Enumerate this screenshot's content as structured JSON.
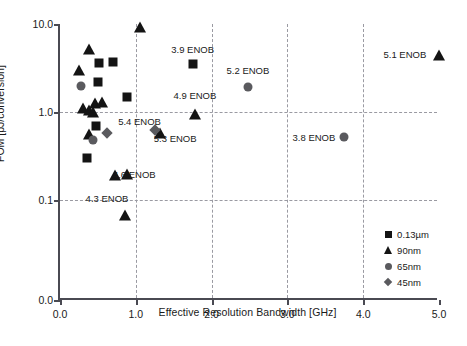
{
  "chart_data": {
    "type": "scatter",
    "title": "",
    "xlabel": "Effective Resolution Bandwidth [GHz]",
    "ylabel": "FOM [pJ/conversion]",
    "xlim": [
      0.0,
      5.0
    ],
    "ylim": [
      0.1,
      10.0
    ],
    "yscale": "log",
    "xscale": "linear",
    "grid": true,
    "legend_position": "bottom-right",
    "xticks": [
      "0.0",
      "1.0",
      "2.0",
      "3.0",
      "4.0",
      "5.0"
    ],
    "xtick_values": [
      0.0,
      1.0,
      2.0,
      3.0,
      4.0,
      5.0
    ],
    "yticks": [
      "0.0",
      "0.1",
      "1.0",
      "10.0"
    ],
    "ytick_values": [
      0.0,
      0.1,
      1.0,
      10.0
    ],
    "series": [
      {
        "name": "0.13µm",
        "marker": "square",
        "color": "#141414",
        "points": [
          {
            "x": 0.52,
            "y": 3.6
          },
          {
            "x": 0.7,
            "y": 3.7
          },
          {
            "x": 0.5,
            "y": 2.2
          },
          {
            "x": 0.88,
            "y": 1.5
          },
          {
            "x": 0.48,
            "y": 0.7
          },
          {
            "x": 0.36,
            "y": 0.3
          },
          {
            "x": 1.75,
            "y": 3.5
          }
        ]
      },
      {
        "name": "90nm",
        "marker": "triangle",
        "color": "#141414",
        "points": [
          {
            "x": 0.38,
            "y": 5.2
          },
          {
            "x": 0.25,
            "y": 3.0
          },
          {
            "x": 1.05,
            "y": 9.3
          },
          {
            "x": 0.3,
            "y": 1.1
          },
          {
            "x": 0.38,
            "y": 1.05
          },
          {
            "x": 0.43,
            "y": 1.0
          },
          {
            "x": 0.46,
            "y": 1.25
          },
          {
            "x": 0.55,
            "y": 1.3
          },
          {
            "x": 0.38,
            "y": 0.56
          },
          {
            "x": 0.72,
            "y": 0.19
          },
          {
            "x": 0.88,
            "y": 0.2
          },
          {
            "x": 0.86,
            "y": 0.067
          },
          {
            "x": 1.32,
            "y": 0.58
          },
          {
            "x": 1.78,
            "y": 0.95
          },
          {
            "x": 5.0,
            "y": 4.5
          }
        ]
      },
      {
        "name": "65nm",
        "marker": "circle",
        "color": "#5a5a5e",
        "points": [
          {
            "x": 0.28,
            "y": 2.0
          },
          {
            "x": 0.43,
            "y": 0.48
          },
          {
            "x": 2.48,
            "y": 1.9
          },
          {
            "x": 3.75,
            "y": 0.52
          }
        ]
      },
      {
        "name": "45nm",
        "marker": "diamond",
        "color": "#5a5a5e",
        "points": [
          {
            "x": 0.62,
            "y": 0.58
          },
          {
            "x": 1.25,
            "y": 0.62
          }
        ]
      }
    ],
    "annotations": [
      {
        "text": "3.9 ENOB",
        "x": 1.75,
        "y": 5.2
      },
      {
        "text": "5.2 ENOB",
        "x": 2.48,
        "y": 3.0
      },
      {
        "text": "5.1 ENOB",
        "x": 4.55,
        "y": 4.6
      },
      {
        "text": "4.9 ENOB",
        "x": 1.78,
        "y": 1.55
      },
      {
        "text": "3.8 ENOB",
        "x": 3.35,
        "y": 0.52
      },
      {
        "text": "5.4 ENOB",
        "x": 1.05,
        "y": 0.8
      },
      {
        "text": "5.3 ENOB",
        "x": 1.52,
        "y": 0.5
      },
      {
        "text": "4.6 ENOB",
        "x": 0.98,
        "y": 0.2
      },
      {
        "text": "4.3 ENOB",
        "x": 0.62,
        "y": 0.105
      }
    ]
  },
  "legend": {
    "items": [
      {
        "label": "0.13µm",
        "marker": "square"
      },
      {
        "label": "90nm",
        "marker": "triangle"
      },
      {
        "label": "65nm",
        "marker": "circle"
      },
      {
        "label": "45nm",
        "marker": "diamond"
      }
    ]
  }
}
